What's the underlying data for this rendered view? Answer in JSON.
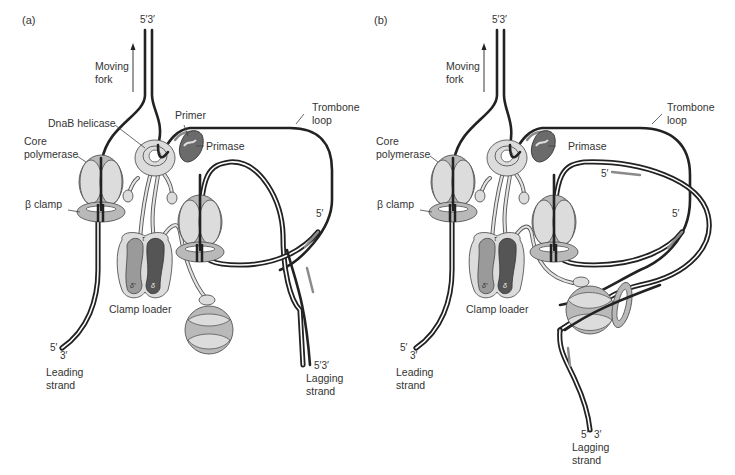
{
  "figure": {
    "colors": {
      "dna_strand": "#222222",
      "rna_primer": "#8a8a8a",
      "protein_light": "#d9d9d9",
      "protein_mid": "#b8b8b8",
      "primase": "#6b6b6b",
      "clamp_loader_delta": "#555555",
      "clamp_loader_delta_prime": "#9a9a9a"
    }
  },
  "panel_a": {
    "tag": "(a)",
    "fork_ends": "5′3′",
    "moving_fork": [
      "Moving",
      "fork"
    ],
    "dnab_helicase": "DnaB helicase",
    "primer": "Primer",
    "primase": "Primase",
    "trombone_loop": [
      "Trombone",
      "loop"
    ],
    "core_polymerase": [
      "Core",
      "polymerase"
    ],
    "beta_clamp": "β clamp",
    "clamp_loader": "Clamp loader",
    "tau": "τ",
    "delta_prime": "δ′",
    "delta": "δ",
    "okazaki_5prime": "5′",
    "leading_5": "5′",
    "leading_3": "3′",
    "leading_strand": [
      "Leading",
      "strand"
    ],
    "lagging_ends": "5′3′",
    "lagging_strand": [
      "Lagging",
      "strand"
    ]
  },
  "panel_b": {
    "tag": "(b)",
    "fork_ends": "5′3′",
    "moving_fork": [
      "Moving",
      "fork"
    ],
    "primase": "Primase",
    "trombone_loop": [
      "Trombone",
      "loop"
    ],
    "core_polymerase": [
      "Core",
      "polymerase"
    ],
    "beta_clamp": "β clamp",
    "clamp_loader": "Clamp loader",
    "tau": "τ",
    "delta_prime": "δ′",
    "delta": "δ",
    "okazaki_5prime_upper": "5′",
    "okazaki_5prime_lower": "5′",
    "leading_5": "5′",
    "leading_3": "3′",
    "leading_strand": [
      "Leading",
      "strand"
    ],
    "lagging_5": "5′",
    "lagging_3": "3′",
    "lagging_strand": [
      "Lagging",
      "strand"
    ]
  }
}
